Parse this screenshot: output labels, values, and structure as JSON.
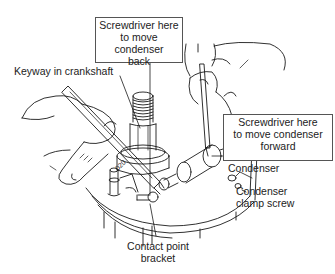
{
  "diagram": {
    "callouts": {
      "screwdriver_back": {
        "lines": [
          "Screwdriver here",
          "to move condenser",
          "back"
        ]
      },
      "screwdriver_forward": {
        "lines": [
          "Screwdriver here",
          "to move condenser",
          "forward"
        ]
      },
      "keyway": {
        "text": "Keyway in crankshaft"
      },
      "condenser": {
        "text": "Condenser"
      },
      "clamp_screw": {
        "lines": [
          "Condenser",
          "clamp screw"
        ]
      },
      "contact_bracket": {
        "lines": [
          "Contact point",
          "bracket"
        ]
      }
    },
    "stamped_marking": "020",
    "colors": {
      "line": "#1a1a1a",
      "box_border": "#555555",
      "background": "#ffffff"
    }
  }
}
